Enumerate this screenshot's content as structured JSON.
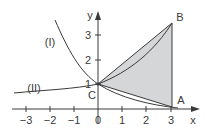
{
  "figure": {
    "axes": {
      "x_label": "x",
      "y_label": "y",
      "x_ticks": [
        "−3",
        "−2",
        "−1",
        "0",
        "1",
        "2",
        "3"
      ],
      "y_ticks": [
        "1",
        "2",
        "3"
      ]
    },
    "curves": [
      {
        "id": "I",
        "label": "(I)",
        "description": "decreasing exponential through C"
      },
      {
        "id": "II",
        "label": "(II)",
        "description": "increasing exponential through C"
      }
    ],
    "points": [
      {
        "name": "A",
        "x": 3,
        "y": 0.1
      },
      {
        "name": "B",
        "x": 3,
        "y": 3.5
      },
      {
        "name": "C",
        "x": 0,
        "y": 1
      }
    ],
    "shaded_region": {
      "vertices": [
        "C",
        "B",
        "A"
      ],
      "color": "#d4d6d8"
    },
    "colors": {
      "line": "#3a3a3a",
      "fill": "#d4d6d8"
    }
  }
}
